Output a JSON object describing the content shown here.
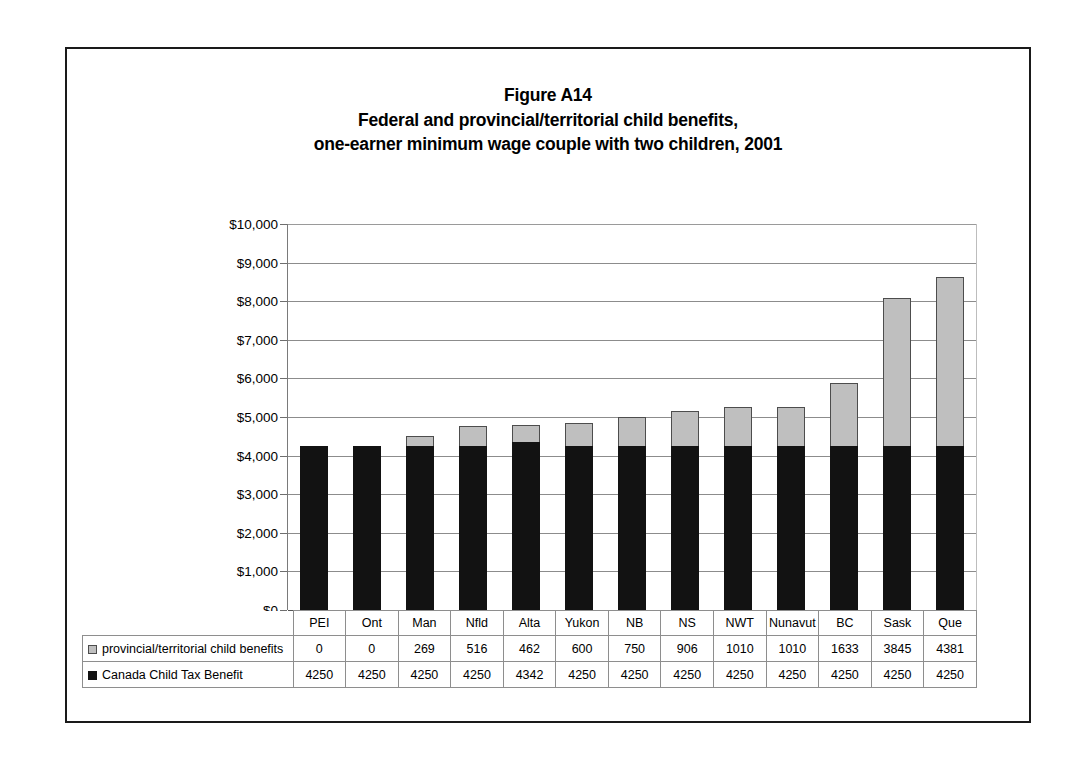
{
  "figure": {
    "title_lines": [
      "Figure A14",
      "Federal and provincial/territorial child benefits,",
      "one-earner minimum wage couple with two children, 2001"
    ]
  },
  "legend": {
    "provincial_label": "provincial/territorial child benefits",
    "federal_label": "Canada Child Tax Benefit",
    "provincial_swatch": "gray-square-icon",
    "federal_swatch": "black-square-icon",
    "provincial_color": "#bfbfbf",
    "federal_color": "#121212"
  },
  "chart_data": {
    "type": "bar",
    "stacked": true,
    "xlabel": "",
    "ylabel": "",
    "ylim": [
      0,
      10000
    ],
    "ytick_step": 1000,
    "ytick_labels": [
      "$10,000",
      "$9,000",
      "$8,000",
      "$7,000",
      "$6,000",
      "$5,000",
      "$4,000",
      "$3,000",
      "$2,000",
      "$1,000",
      "$0"
    ],
    "ytick_values": [
      10000,
      9000,
      8000,
      7000,
      6000,
      5000,
      4000,
      3000,
      2000,
      1000,
      0
    ],
    "grid": true,
    "legend_position": "table-below",
    "categories": [
      "PEI",
      "Ont",
      "Man",
      "Nfld",
      "Alta",
      "Yukon",
      "NB",
      "NS",
      "NWT",
      "Nunavut",
      "BC",
      "Sask",
      "Que"
    ],
    "series": [
      {
        "name": "provincial/territorial child benefits",
        "color": "#bfbfbf",
        "values": [
          0,
          0,
          269,
          516,
          462,
          600,
          750,
          906,
          1010,
          1010,
          1633,
          3845,
          4381
        ]
      },
      {
        "name": "Canada Child Tax Benefit",
        "color": "#121212",
        "values": [
          4250,
          4250,
          4250,
          4250,
          4342,
          4250,
          4250,
          4250,
          4250,
          4250,
          4250,
          4250,
          4250
        ]
      }
    ],
    "totals": [
      4250,
      4250,
      4519,
      4766,
      4804,
      4850,
      5000,
      5156,
      5260,
      5260,
      5883,
      8095,
      8631
    ]
  }
}
